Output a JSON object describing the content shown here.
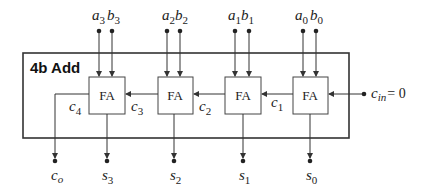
{
  "diagram": {
    "title": "4b Add",
    "block_label": "FA",
    "colors": {
      "line": "#333333",
      "box_fill": "#ffffff",
      "text": "#222222"
    },
    "inputs": [
      {
        "a": "a",
        "a_sub": "3",
        "b": "b",
        "b_sub": "3"
      },
      {
        "a": "a",
        "a_sub": "2",
        "b": "b",
        "b_sub": "2"
      },
      {
        "a": "a",
        "a_sub": "1",
        "b": "b",
        "b_sub": "1"
      },
      {
        "a": "a",
        "a_sub": "0",
        "b": "b",
        "b_sub": "0"
      }
    ],
    "carries": [
      {
        "name": "c",
        "sub": "4"
      },
      {
        "name": "c",
        "sub": "3"
      },
      {
        "name": "c",
        "sub": "2"
      },
      {
        "name": "c",
        "sub": "1"
      }
    ],
    "carry_in": {
      "name": "c",
      "sub": "in",
      "value": "= 0"
    },
    "outputs": [
      {
        "name": "c",
        "sub": "o"
      },
      {
        "name": "s",
        "sub": "3"
      },
      {
        "name": "s",
        "sub": "2"
      },
      {
        "name": "s",
        "sub": "1"
      },
      {
        "name": "s",
        "sub": "0"
      }
    ]
  }
}
